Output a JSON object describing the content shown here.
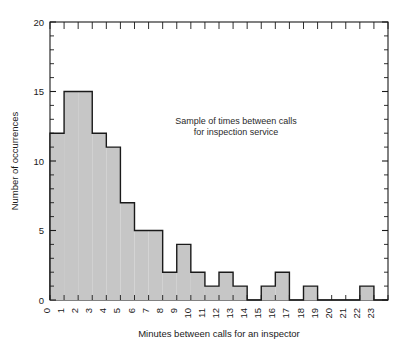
{
  "chart_data": {
    "type": "bar",
    "title": "",
    "subtitle": "",
    "xlabel": "Minutes between calls for an inspector",
    "ylabel": "Number of occurrences",
    "categories": [
      "0",
      "1",
      "2",
      "3",
      "4",
      "5",
      "6",
      "7",
      "8",
      "9",
      "10",
      "11",
      "12",
      "13",
      "14",
      "15",
      "16",
      "17",
      "18",
      "19",
      "20",
      "21",
      "22",
      "23"
    ],
    "values": [
      12,
      15,
      15,
      12,
      11,
      7,
      5,
      5,
      2,
      4,
      2,
      1,
      2,
      1,
      0,
      1,
      2,
      0,
      1,
      0,
      0,
      0,
      1,
      0
    ],
    "xlim": [
      0,
      24
    ],
    "ylim": [
      0,
      20
    ],
    "y_ticks": [
      "0",
      "5",
      "10",
      "15",
      "20"
    ],
    "y_tick_values": [
      0,
      5,
      10,
      15,
      20
    ],
    "y_minor_tick_step": 1,
    "grid": false,
    "legend": null,
    "annotations": [
      {
        "line1": "Sample of times between calls",
        "line2": "for inspection service",
        "x": 9.2,
        "y": 13.2
      }
    ],
    "bar_fill": "#c6c6c6",
    "bar_edge": "#1a1a1a",
    "axis_color": "#1a1a1a",
    "background": "#ffffff"
  }
}
